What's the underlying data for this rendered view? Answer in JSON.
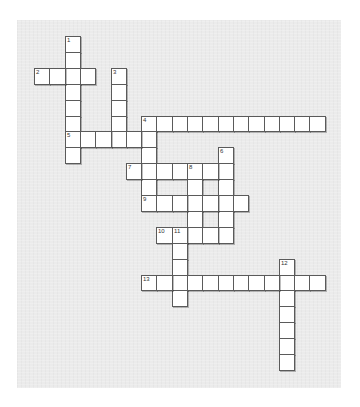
{
  "puzzle": {
    "type": "crossword",
    "grid_origin": {
      "x": 34,
      "y": 36
    },
    "cell_pitch": {
      "x": 15.3,
      "y": 15.9
    },
    "colors": {
      "paper": "#ebebeb",
      "cell_fill": "#ffffff",
      "cell_border": "#5a5a5a",
      "number_text": "#333333"
    },
    "entries": [
      {
        "number": "1",
        "direction": "down",
        "row": 0,
        "col": 2,
        "length": 8
      },
      {
        "number": "2",
        "direction": "across",
        "row": 2,
        "col": 0,
        "length": 4
      },
      {
        "number": "3",
        "direction": "down",
        "row": 2,
        "col": 5,
        "length": 5
      },
      {
        "number": "4",
        "direction": "across",
        "row": 5,
        "col": 7,
        "length": 12
      },
      {
        "number": "4",
        "direction": "down",
        "row": 5,
        "col": 7,
        "length": 6
      },
      {
        "number": "5",
        "direction": "across",
        "row": 6,
        "col": 2,
        "length": 6
      },
      {
        "number": "6",
        "direction": "down",
        "row": 7,
        "col": 12,
        "length": 6
      },
      {
        "number": "7",
        "direction": "across",
        "row": 8,
        "col": 6,
        "length": 7
      },
      {
        "number": "8",
        "direction": "down",
        "row": 8,
        "col": 10,
        "length": 5
      },
      {
        "number": "9",
        "direction": "across",
        "row": 10,
        "col": 7,
        "length": 7
      },
      {
        "number": "10",
        "direction": "across",
        "row": 12,
        "col": 8,
        "length": 5
      },
      {
        "number": "11",
        "direction": "down",
        "row": 12,
        "col": 9,
        "length": 5
      },
      {
        "number": "12",
        "direction": "down",
        "row": 14,
        "col": 16,
        "length": 7
      },
      {
        "number": "13",
        "direction": "across",
        "row": 15,
        "col": 7,
        "length": 12
      }
    ]
  }
}
